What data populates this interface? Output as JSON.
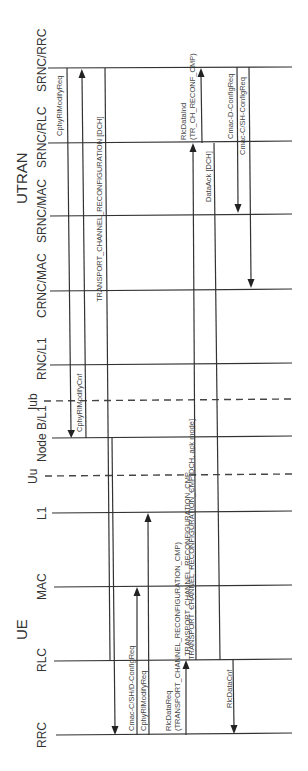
{
  "diagram": {
    "type": "sequence",
    "orientation": "rotated-90-ccw",
    "groups": [
      {
        "label": "UTRAN",
        "x": 22,
        "y": 180
      },
      {
        "label": "UE",
        "x": 22,
        "y": 628
      }
    ],
    "entities": [
      {
        "id": "srnc_rrc",
        "label": "SRNC/RRC",
        "y": 68,
        "style": "solid"
      },
      {
        "id": "srnc_rlc",
        "label": "SRNC/RLC",
        "y": 143,
        "style": "solid"
      },
      {
        "id": "srnc_mac",
        "label": "SRNC/MAC",
        "y": 215,
        "style": "solid"
      },
      {
        "id": "crnc_mac",
        "label": "CRNC/MAC",
        "y": 290,
        "style": "solid"
      },
      {
        "id": "rnc_l1",
        "label": "RNC/L1",
        "y": 365,
        "style": "solid"
      },
      {
        "id": "iub",
        "label": "Iub",
        "y": 400,
        "style": "dashed"
      },
      {
        "id": "nodeb_l1",
        "label": "Node B/L1",
        "y": 438,
        "style": "solid"
      },
      {
        "id": "uu",
        "label": "Uu",
        "y": 475,
        "style": "dashed"
      },
      {
        "id": "ue_l1",
        "label": "L1",
        "y": 513,
        "style": "solid"
      },
      {
        "id": "ue_mac",
        "label": "MAC",
        "y": 586,
        "style": "solid"
      },
      {
        "id": "ue_rlc",
        "label": "RLC",
        "y": 660,
        "style": "solid"
      },
      {
        "id": "ue_rrc",
        "label": "RRC",
        "y": 735,
        "style": "solid"
      }
    ],
    "messages": [
      {
        "label": "CphyRlModifyReq",
        "from": "srnc_rrc",
        "to": "nodeb_l1",
        "x": 67
      },
      {
        "label": "CphyRlModifyCnf",
        "from": "nodeb_l1",
        "to": "srnc_rrc",
        "x": 82
      },
      {
        "label": "TRANSPORT_CHANNEL_RECONFIGURATION [DCH]",
        "from": "srnc_rrc",
        "to": "ue_rlc",
        "x": 105
      },
      {
        "label": "Cmac-C/SH/D-ConfigReq",
        "from": "ue_mac",
        "to": "ue_rrc",
        "x": 115
      },
      {
        "label": "CphyRlModifyReq",
        "from": "ue_rrc",
        "to": "ue_mac",
        "x": 137
      },
      {
        "label": "RlcDataReq (TRANSPORT_CHANNEL_RECONFIGURATION_CMP)",
        "from": "ue_rrc",
        "to": "ue_rlc",
        "x": 186
      },
      {
        "label": "TRANSPORT_CHANNEL_RECONFIGURATION_CMP",
        "from": "ue_rlc",
        "to": "ue_l1",
        "x": 148
      },
      {
        "label": "TRANSPORT_CHANNEL_RECONFIGURATION_CMP[DCH, ack mode]",
        "from": "ue_l1",
        "to": "srnc_rlc",
        "x": 193
      },
      {
        "label": "RlcDataInd (TR_CH_RECONF_CMP)",
        "from": "srnc_rlc",
        "to": "srnc_rrc",
        "x": 200
      },
      {
        "label": "DataAck [DCH]",
        "from": "srnc_rlc",
        "to": "ue_rlc",
        "x": 214
      },
      {
        "label": "RlcDataCnf",
        "from": "ue_rlc",
        "to": "ue_rrc",
        "x": 234
      },
      {
        "label": "Cmac-D-ConfigReq",
        "from": "srnc_rrc",
        "to": "srnc_mac",
        "x": 238
      },
      {
        "label": "Cmac-C/SH-ConfigReq",
        "from": "srnc_rrc",
        "to": "crnc_mac",
        "x": 250
      }
    ]
  },
  "labels": {
    "utran": "UTRAN",
    "ue": "UE",
    "srnc_rrc": "SRNC/RRC",
    "srnc_rlc": "SRNC/RLC",
    "srnc_mac": "SRNC/MAC",
    "crnc_mac": "CRNC/MAC",
    "rnc_l1": "RNC/L1",
    "iub": "Iub",
    "nodeb_l1": "Node B/L1",
    "uu": "Uu",
    "ue_l1": "L1",
    "ue_mac": "MAC",
    "ue_rlc": "RLC",
    "ue_rrc": "RRC",
    "m_cphy_req_top": "CphyRlModifyReq",
    "m_cphy_cnf": "CphyRlModifyCnf",
    "m_tcr_dch": "TRANSPORT_CHANNEL_RECONFIGURATION [DCH]",
    "m_cmac_ue": "Cmac-C/SH/D-ConfigReq",
    "m_cphy_req_ue": "CphyRlModifyReq",
    "m_rlcdatareq_1": "RlcDataReq",
    "m_rlcdatareq_2": "(TRANSPORT_CHANNEL_RECONFIGURATION_CMP)",
    "m_tcr_cmp_ue": "TRANSPORT_CHANNEL_RECONFIGURATION_CMP",
    "m_tcr_cmp_air": "TRANSPORT_CHANNEL_RECONFIGURATION_CMP[DCH, ack mode]",
    "m_rlcdataind_1": "RlcDataInd",
    "m_rlcdataind_2": "(TR_CH_RECONF_CMP)",
    "m_dataack": "DataAck [DCH]",
    "m_rlcdatacnf": "RlcDataCnf",
    "m_cmac_d": "Cmac-D-ConfigReq",
    "m_cmac_csh": "Cmac-C/SH-ConfigReq"
  }
}
